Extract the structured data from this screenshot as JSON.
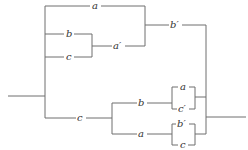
{
  "diagram": {
    "type": "switching-circuit",
    "labels": {
      "top_a": "a",
      "upper_b": "b",
      "upper_c": "c",
      "a_prime": "a′",
      "b_prime": "b′",
      "lower_c": "c",
      "lower_b": "b",
      "lower_a": "a",
      "inner1_a": "a",
      "inner1_c_prime": "c′",
      "inner2_b_prime": "b′",
      "inner2_c": "c"
    },
    "colors": {
      "wire": "#6e6e6e",
      "text": "#333333",
      "background": "#ffffff"
    }
  }
}
